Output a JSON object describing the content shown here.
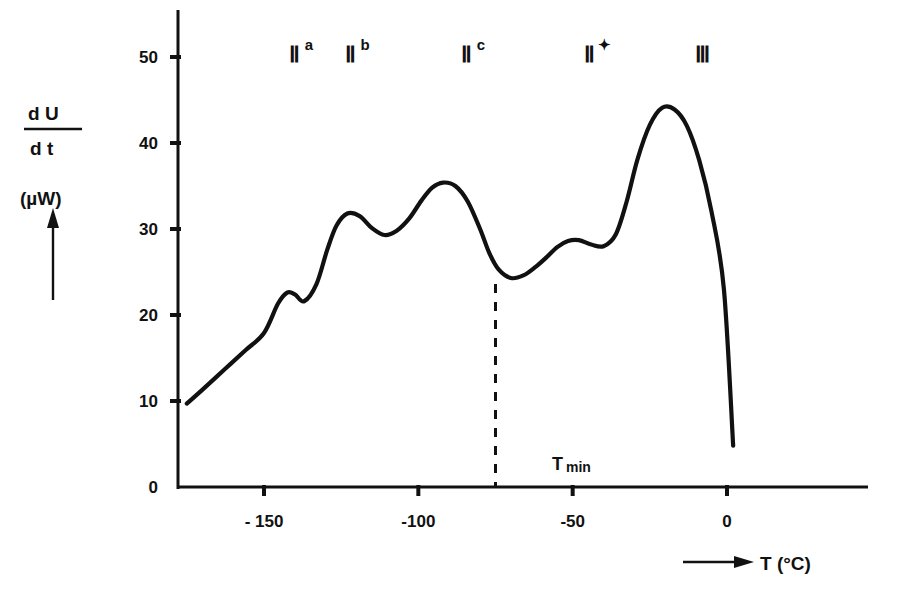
{
  "chart_data": {
    "type": "line",
    "title": "",
    "xlabel": "T (°C)",
    "ylabel": "dU/dt (µW)",
    "ylabel_numerator": "d U",
    "ylabel_denominator": "d t",
    "ylabel_units": "(µW)",
    "xlim": [
      -175,
      5
    ],
    "ylim": [
      0,
      55
    ],
    "grid": false,
    "legend": "none",
    "x_ticks": [
      -150,
      -100,
      -50,
      0
    ],
    "x_tick_labels": [
      "- 150",
      "-100",
      "-50",
      "0"
    ],
    "y_ticks": [
      0,
      10,
      20,
      30,
      40,
      50
    ],
    "y_tick_labels": [
      "0",
      "10",
      "20",
      "30",
      "40",
      "50"
    ],
    "series": [
      {
        "name": "dU/dt",
        "x": [
          -175.0,
          -170.0,
          -163.0,
          -156.0,
          -150.0,
          -145.5,
          -142.5,
          -140.0,
          -137.0,
          -133.0,
          -129.5,
          -126.5,
          -123.0,
          -119.0,
          -115.0,
          -111.0,
          -107.0,
          -103.0,
          -99.0,
          -95.5,
          -92.0,
          -88.0,
          -84.0,
          -80.0,
          -77.0,
          -74.0,
          -70.0,
          -66.0,
          -62.0,
          -58.5,
          -55.0,
          -51.5,
          -48.0,
          -44.0,
          -40.0,
          -36.0,
          -32.5,
          -29.0,
          -25.0,
          -21.0,
          -17.0,
          -13.0,
          -9.0,
          -5.0,
          -1.0,
          2.0
        ],
        "y": [
          9.7,
          11.3,
          13.6,
          15.9,
          17.9,
          21.3,
          22.6,
          22.4,
          21.6,
          23.6,
          27.6,
          30.4,
          31.8,
          31.5,
          30.1,
          29.3,
          29.8,
          31.2,
          33.3,
          34.8,
          35.4,
          35.0,
          33.2,
          30.0,
          27.2,
          25.3,
          24.3,
          24.6,
          25.6,
          26.7,
          27.9,
          28.6,
          28.7,
          28.2,
          28.0,
          29.4,
          33.2,
          38.1,
          42.1,
          44.1,
          43.9,
          42.0,
          38.0,
          32.0,
          23.0,
          4.8
        ]
      }
    ],
    "annotations": [
      {
        "id": "II-a",
        "base": "Ⅱ",
        "sup": "a",
        "x_px": 295,
        "y_px": 62
      },
      {
        "id": "II-b",
        "base": "Ⅱ",
        "sup": "b",
        "x_px": 351,
        "y_px": 62
      },
      {
        "id": "II-c",
        "base": "Ⅱ",
        "sup": "c",
        "x_px": 467,
        "y_px": 62
      },
      {
        "id": "II-star",
        "base": "Ⅱ",
        "sup": "✦",
        "x_px": 590,
        "y_px": 62
      },
      {
        "id": "III",
        "base": "Ⅲ",
        "sup": "",
        "x_px": 703,
        "y_px": 62
      }
    ],
    "marker_line": {
      "label_main": "T",
      "label_sub": "min",
      "x_value": -75,
      "y_top_value": 24.3,
      "style": "dashed"
    }
  },
  "axes": {
    "x_arrow_label": "T (°C)",
    "y_arrow_present": true
  }
}
